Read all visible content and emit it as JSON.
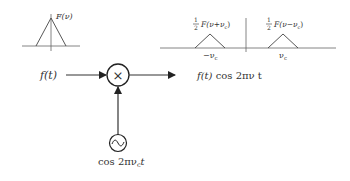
{
  "baseband_spectrum": {
    "label": "F(ν)"
  },
  "modulated_spectrum": {
    "left_half": "1",
    "left_den": "2",
    "left_label": "F(ν+ν",
    "left_sub": "c",
    "left_close": ")",
    "right_half": "1",
    "right_den": "2",
    "right_label": "F(ν−ν",
    "right_sub": "c",
    "right_close": ")",
    "left_axis_label": "−ν",
    "left_axis_sub": "c",
    "right_axis_label": "ν",
    "right_axis_sub": "c"
  },
  "block": {
    "input_label": "f(t)",
    "multiplier_symbol": "×",
    "output_label_f": "f(t)",
    "output_label_rest": " cos 2πν t",
    "oscillator_label_pre": "cos 2πν",
    "oscillator_label_sub": "c",
    "oscillator_label_post": "t",
    "oscillator_symbol": "∿"
  }
}
